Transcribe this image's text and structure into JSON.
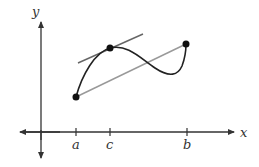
{
  "diagram": {
    "axes": {
      "x_label": "x",
      "y_label": "y"
    },
    "ticks": [
      {
        "label": "a",
        "x": 76
      },
      {
        "label": "c",
        "x": 110
      },
      {
        "label": "b",
        "x": 187
      }
    ],
    "points": [
      {
        "name": "A",
        "x": 76,
        "y": 97
      },
      {
        "name": "C",
        "x": 110,
        "y": 48
      },
      {
        "name": "B",
        "x": 186,
        "y": 44
      }
    ],
    "colors": {
      "axis": "#333333",
      "curve": "#222222",
      "tangent": "#666666",
      "secant": "#999999",
      "point": "#111111"
    }
  }
}
